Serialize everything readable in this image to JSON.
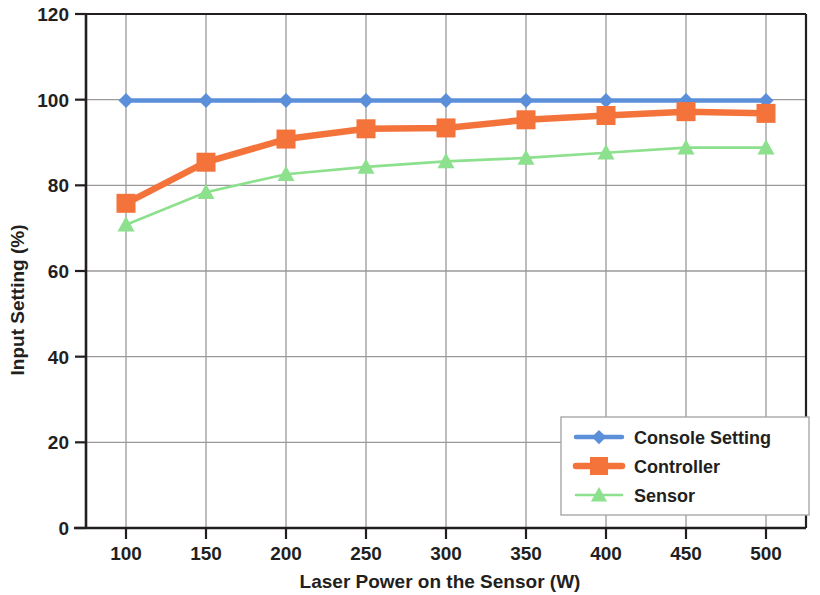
{
  "chart_data": {
    "type": "line",
    "title": "",
    "xlabel": "Laser Power on the Sensor (W)",
    "ylabel": "Input Setting (%)",
    "x": [
      100,
      150,
      200,
      250,
      300,
      350,
      400,
      450,
      500
    ],
    "xticklabels": [
      "100",
      "150",
      "200",
      "250",
      "300",
      "350",
      "400",
      "450",
      "500"
    ],
    "yticklabels": [
      "0",
      "20",
      "40",
      "60",
      "80",
      "100",
      "120"
    ],
    "yticks": [
      0,
      20,
      40,
      60,
      80,
      100,
      120
    ],
    "xlim": [
      75,
      525
    ],
    "ylim": [
      0,
      120
    ],
    "grid": true,
    "legend_position": "lower right",
    "series": [
      {
        "name": "Console Setting",
        "color": "#5B8FD9",
        "marker": "diamond",
        "values": [
          99.8,
          99.8,
          99.8,
          99.8,
          99.8,
          99.8,
          99.8,
          99.8,
          99.8
        ]
      },
      {
        "name": "Controller",
        "color": "#F4733B",
        "marker": "square",
        "values": [
          75.8,
          85.4,
          90.8,
          93.2,
          93.4,
          95.3,
          96.3,
          97.2,
          96.8
        ]
      },
      {
        "name": "Sensor",
        "color": "#8DE08D",
        "marker": "triangle",
        "values": [
          70.8,
          78.4,
          82.6,
          84.3,
          85.6,
          86.4,
          87.6,
          88.8,
          88.8
        ]
      }
    ]
  },
  "legend": {
    "entries": [
      {
        "label": "Console Setting"
      },
      {
        "label": "Controller"
      },
      {
        "label": "Sensor"
      }
    ]
  },
  "colors": {
    "console_setting": "#5B8FD9",
    "controller": "#F4733B",
    "sensor": "#8DE08D",
    "grid": "#9a9a9a",
    "axis": "#231f20",
    "background": "#ffffff"
  }
}
